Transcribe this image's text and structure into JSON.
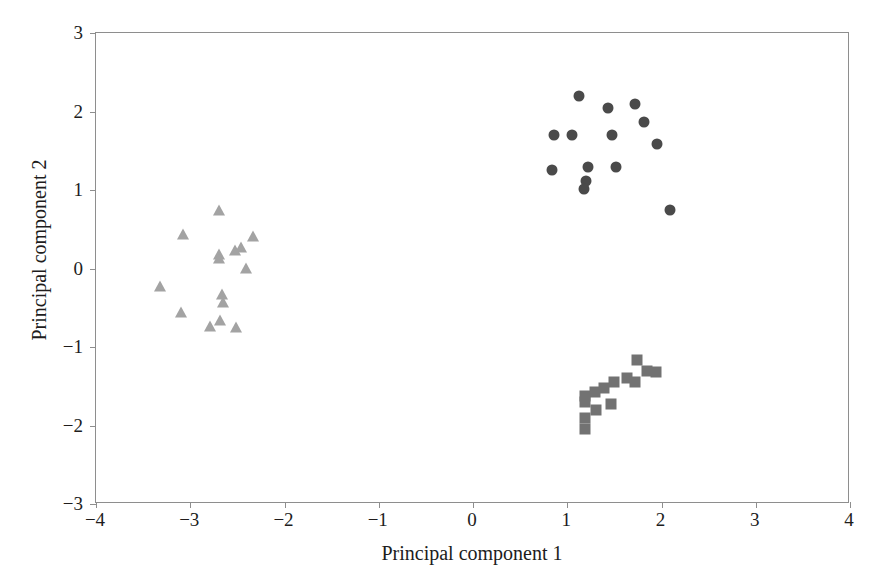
{
  "chart_data": {
    "type": "scatter",
    "title": "",
    "xlabel": "Principal component 1",
    "ylabel": "Principal component 2",
    "xlim": [
      -4,
      4
    ],
    "ylim": [
      -3,
      3
    ],
    "xticks": [
      -4,
      -3,
      -2,
      -1,
      0,
      1,
      2,
      3,
      4
    ],
    "yticks": [
      -3,
      -2,
      -1,
      0,
      1,
      2,
      3
    ],
    "xticklabels": [
      "−4",
      "−3",
      "−2",
      "−1",
      "0",
      "1",
      "2",
      "3",
      "4"
    ],
    "yticklabels": [
      "−3",
      "−2",
      "−1",
      "0",
      "1",
      "2",
      "3"
    ],
    "grid": false,
    "legend": "none",
    "series": [
      {
        "name": "Group 1",
        "marker": "circle",
        "color": "#4a4a4a",
        "points": [
          [
            1.12,
            2.2
          ],
          [
            1.43,
            2.05
          ],
          [
            1.72,
            2.09
          ],
          [
            0.86,
            1.7
          ],
          [
            1.05,
            1.7
          ],
          [
            1.48,
            1.7
          ],
          [
            1.81,
            1.86
          ],
          [
            1.95,
            1.58
          ],
          [
            0.84,
            1.26
          ],
          [
            1.22,
            1.29
          ],
          [
            1.52,
            1.29
          ],
          [
            1.2,
            1.12
          ],
          [
            1.18,
            1.01
          ],
          [
            2.09,
            0.74
          ]
        ]
      },
      {
        "name": "Group 2",
        "marker": "triangle",
        "color": "#a3a3a3",
        "points": [
          [
            -2.69,
            0.74
          ],
          [
            -3.08,
            0.44
          ],
          [
            -2.33,
            0.41
          ],
          [
            -2.46,
            0.27
          ],
          [
            -2.52,
            0.23
          ],
          [
            -2.69,
            0.18
          ],
          [
            -2.7,
            0.13
          ],
          [
            -2.41,
            0.01
          ],
          [
            -3.32,
            -0.22
          ],
          [
            -2.66,
            -0.33
          ],
          [
            -2.65,
            -0.43
          ],
          [
            -3.1,
            -0.55
          ],
          [
            -2.68,
            -0.66
          ],
          [
            -2.79,
            -0.73
          ],
          [
            -2.51,
            -0.74
          ]
        ]
      },
      {
        "name": "Group 3",
        "marker": "square",
        "color": "#727272",
        "points": [
          [
            1.74,
            -1.17
          ],
          [
            1.85,
            -1.3
          ],
          [
            1.94,
            -1.32
          ],
          [
            1.63,
            -1.39
          ],
          [
            1.5,
            -1.45
          ],
          [
            1.72,
            -1.44
          ],
          [
            1.39,
            -1.52
          ],
          [
            1.29,
            -1.57
          ],
          [
            1.19,
            -1.62
          ],
          [
            1.19,
            -1.7
          ],
          [
            1.46,
            -1.72
          ],
          [
            1.3,
            -1.8
          ],
          [
            1.19,
            -1.91
          ],
          [
            1.19,
            -2.05
          ]
        ]
      }
    ]
  },
  "axes": {
    "frame_color": "#8e8e8e",
    "tick_color": "#8e8e8e",
    "text_color": "#201c1c",
    "background": "#ffffff"
  }
}
